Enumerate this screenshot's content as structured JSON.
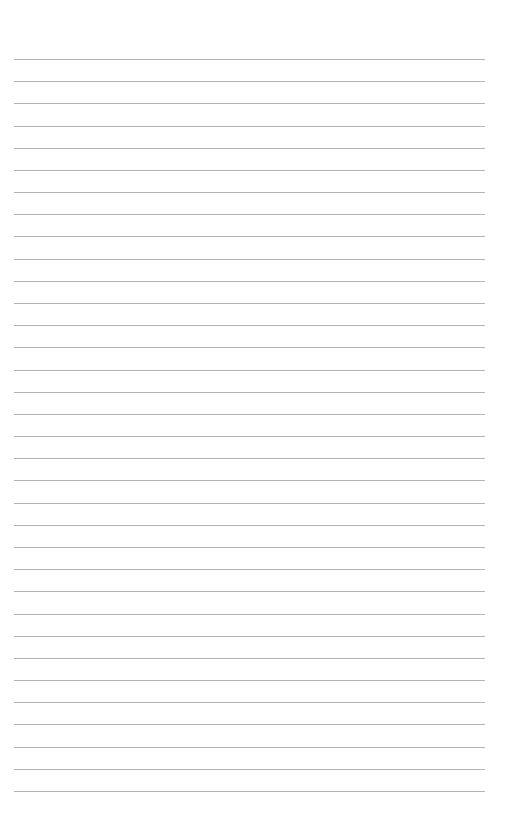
{
  "page": {
    "type": "blank-lined-paper",
    "line_count": 34,
    "first_line_y": 59,
    "last_line_y": 791,
    "line_left": 14,
    "line_right": 485,
    "line_color": "#b4b4b4",
    "background": "#ffffff"
  }
}
